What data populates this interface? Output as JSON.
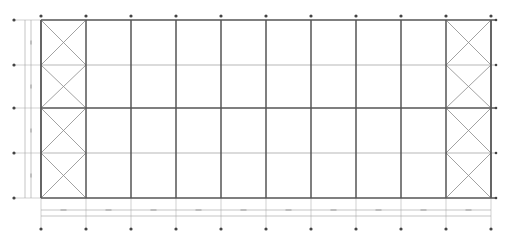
{
  "drawing": {
    "type": "steel frame structural plan",
    "colors": {
      "background": "#ffffff",
      "main_member": "#555555",
      "secondary_line": "#9a9a9a",
      "bracing": "#8a8a8a",
      "axis_marker": "#444444",
      "dimension_line": "#a0a0a0"
    },
    "grid": {
      "columns_x": [
        41,
        86,
        131,
        176,
        221,
        266,
        311,
        356,
        401,
        446,
        491
      ],
      "rows_y": [
        20,
        65,
        108,
        153,
        198
      ],
      "column_count": 11,
      "row_count": 5
    },
    "braced_bays": [
      {
        "name": "left-end-bay",
        "x1": 41,
        "x2": 86
      },
      {
        "name": "right-end-bay",
        "x1": 446,
        "x2": 491
      }
    ],
    "dimension_lines": {
      "bottom_y": [
        210,
        216
      ],
      "left_x": [
        25,
        31
      ],
      "bottom_markers_y": 229,
      "left_markers_x": 14
    }
  }
}
